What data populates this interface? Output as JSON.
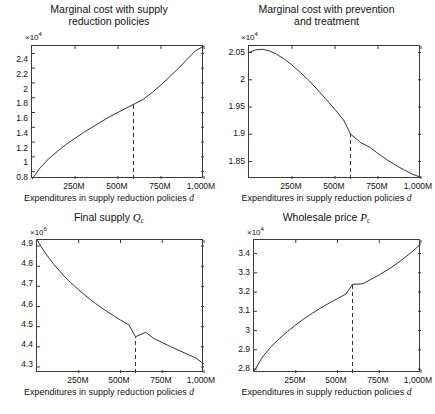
{
  "figure": {
    "panel_count": 4,
    "background": "#ffffff",
    "line_color": "#333333",
    "axis_color": "#3a3a3a",
    "marker_style": "dashed",
    "shared_xlabel": "Expenditures in supply reduction policies",
    "shared_xlabel_var": "d",
    "shared_xticks": [
      "250M",
      "500M",
      "750M",
      "1,000M"
    ]
  },
  "chart_data": [
    {
      "type": "line",
      "title": "Marginal cost with supply reduction policies",
      "title_line1": "Marginal cost with supply",
      "title_line2": "reduction policies",
      "xlabel": "Expenditures in supply reduction policies d",
      "ylabel": "",
      "y_exponent": "×10",
      "y_exponent_power": "4",
      "xlim": [
        0,
        1000
      ],
      "ylim": [
        0.7,
        2.5
      ],
      "xticks": [
        250,
        500,
        750,
        1000
      ],
      "xticklabels": [
        "250M",
        "500M",
        "750M",
        "1,000M"
      ],
      "yticks": [
        0.8,
        1,
        1.2,
        1.4,
        1.6,
        1.8,
        2,
        2.2,
        2.4
      ],
      "yticklabels": [
        "0.8",
        "1",
        "1.2",
        "1.4",
        "1.6",
        "1.8",
        "2",
        "2.2",
        "2.4"
      ],
      "grid": false,
      "legend": null,
      "marker_x": 590,
      "marker_y": 1.87,
      "x": [
        0,
        50,
        100,
        150,
        200,
        250,
        300,
        350,
        400,
        450,
        500,
        550,
        590,
        600,
        650,
        700,
        750,
        800,
        850,
        900,
        950,
        1000
      ],
      "values": [
        0.7,
        0.86,
        0.98,
        1.08,
        1.17,
        1.25,
        1.33,
        1.4,
        1.47,
        1.54,
        1.6,
        1.66,
        1.87,
        1.72,
        1.78,
        1.84,
        1.93,
        2.03,
        2.14,
        2.25,
        2.37,
        2.48
      ]
    },
    {
      "type": "line",
      "title": "Marginal cost with prevention and treatment",
      "title_line1": "Marginal cost with prevention",
      "title_line2": "and treatment",
      "xlabel": "Expenditures in supply reduction policies d",
      "ylabel": "",
      "y_exponent": "×10",
      "y_exponent_power": "4",
      "xlim": [
        0,
        1000
      ],
      "ylim": [
        1.818,
        2.062
      ],
      "xticks": [
        250,
        500,
        750,
        1000
      ],
      "xticklabels": [
        "250M",
        "500M",
        "750M",
        "1,000M"
      ],
      "yticks": [
        1.85,
        1.9,
        1.95,
        2,
        2.05
      ],
      "yticklabels": [
        "1.85",
        "1.9",
        "1.95",
        "2",
        "2.05"
      ],
      "grid": false,
      "legend": null,
      "marker_x": 590,
      "marker_y": 1.9,
      "x": [
        0,
        40,
        80,
        120,
        160,
        200,
        250,
        300,
        350,
        400,
        450,
        500,
        550,
        590,
        650,
        700,
        750,
        800,
        850,
        900,
        950,
        1000
      ],
      "values": [
        2.05,
        2.055,
        2.056,
        2.053,
        2.047,
        2.039,
        2.027,
        2.013,
        1.998,
        1.981,
        1.963,
        1.945,
        1.926,
        1.9,
        1.884,
        1.876,
        1.864,
        1.853,
        1.843,
        1.834,
        1.826,
        1.82
      ]
    },
    {
      "type": "line",
      "title": "Final supply Qc",
      "title_prefix": "Final supply",
      "title_var": "Q",
      "title_sub": "c",
      "xlabel": "Expenditures in supply reduction policies d",
      "ylabel": "",
      "y_exponent": "×10",
      "y_exponent_power": "6",
      "xlim": [
        0,
        1000
      ],
      "ylim": [
        4.27,
        4.93
      ],
      "xticks": [
        250,
        500,
        750,
        1000
      ],
      "xticklabels": [
        "250M",
        "500M",
        "750M",
        "1,000M"
      ],
      "yticks": [
        4.3,
        4.4,
        4.5,
        4.6,
        4.7,
        4.8,
        4.9
      ],
      "yticklabels": [
        "4.3",
        "4.4",
        "4.5",
        "4.6",
        "4.7",
        "4.8",
        "4.9"
      ],
      "grid": false,
      "legend": null,
      "marker_x": 590,
      "marker_y": 4.44,
      "x": [
        0,
        50,
        100,
        150,
        200,
        250,
        300,
        350,
        400,
        450,
        500,
        550,
        590,
        650,
        700,
        750,
        800,
        850,
        900,
        950,
        1000
      ],
      "values": [
        4.92,
        4.855,
        4.8,
        4.752,
        4.71,
        4.672,
        4.637,
        4.605,
        4.576,
        4.549,
        4.523,
        4.499,
        4.44,
        4.443,
        4.412,
        4.392,
        4.372,
        4.353,
        4.334,
        4.316,
        4.285
      ]
    },
    {
      "type": "line",
      "title": "Wholesale price Pc",
      "title_prefix": "Wholesale price",
      "title_var": "P",
      "title_sub": "c",
      "xlabel": "Expenditures in supply reduction policies d",
      "ylabel": "",
      "y_exponent": "×10",
      "y_exponent_power": "4",
      "xlim": [
        0,
        1000
      ],
      "ylim": [
        2.78,
        3.47
      ],
      "xticks": [
        250,
        500,
        750,
        1000
      ],
      "xticklabels": [
        "250M",
        "500M",
        "750M",
        "1,000M"
      ],
      "yticks": [
        2.8,
        2.9,
        3,
        3.1,
        3.2,
        3.3,
        3.4
      ],
      "yticklabels": [
        "2.8",
        "2.9",
        "3",
        "3.1",
        "3.2",
        "3.3",
        "3.4"
      ],
      "grid": false,
      "legend": null,
      "marker_x": 590,
      "marker_y": 3.24,
      "x": [
        0,
        50,
        100,
        150,
        200,
        250,
        300,
        350,
        400,
        450,
        500,
        550,
        590,
        650,
        700,
        750,
        800,
        850,
        900,
        950,
        1000
      ],
      "values": [
        2.79,
        2.862,
        2.915,
        2.958,
        2.996,
        3.03,
        3.062,
        3.091,
        3.118,
        3.143,
        3.167,
        3.19,
        3.24,
        3.243,
        3.266,
        3.29,
        3.316,
        3.345,
        3.377,
        3.412,
        3.452
      ]
    }
  ]
}
